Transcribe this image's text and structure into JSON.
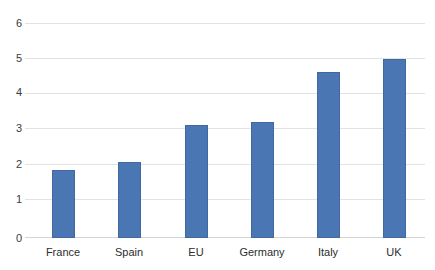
{
  "chart_data": {
    "type": "bar",
    "title": "",
    "subtitle": "",
    "xlabel": "",
    "ylabel": "",
    "categories": [
      "France",
      "Spain",
      "EU",
      "Germany",
      "Italy",
      "UK"
    ],
    "values": [
      1.9,
      2.12,
      3.15,
      3.25,
      4.62,
      5.0
    ],
    "series": [
      {
        "name": "",
        "values": [
          1.9,
          2.12,
          3.15,
          3.25,
          4.62,
          5.0
        ],
        "color": "#4a76b4"
      }
    ],
    "ylim": [
      0,
      6
    ],
    "ytick_labels": [
      "0",
      "1",
      "2",
      "3",
      "4",
      "5",
      "6"
    ],
    "ytick_values": [
      0,
      1,
      2,
      3,
      4,
      5,
      6
    ],
    "grid": true,
    "grid_axis": "y",
    "legend": false,
    "legend_position": "none",
    "annotations": [],
    "colors": {
      "bar_fill": "#4a76b4",
      "bar_border": "#41689f",
      "gridline": "#e2e2e2",
      "baseline": "#d4d4d4",
      "background": "#ffffff",
      "tick_text": "#2d2d2d"
    }
  }
}
